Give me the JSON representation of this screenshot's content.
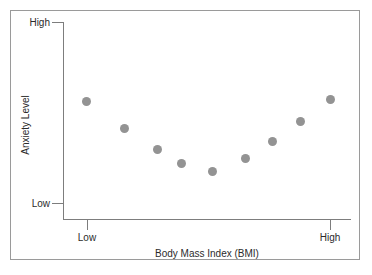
{
  "figure": {
    "background_color": "#ffffff",
    "frame_color": "#9a9a9a",
    "axis_color": "#7d7d7d",
    "marker_color": "#939393"
  },
  "axes": {
    "y_title": "Anxiety Level",
    "x_title": "Body Mass Index (BMI)",
    "y_tick_labels": [
      "High",
      "Low"
    ],
    "x_tick_labels": [
      "Low",
      "High"
    ]
  },
  "chart_data": {
    "type": "scatter",
    "title": "",
    "xlabel": "Body Mass Index (BMI)",
    "ylabel": "Anxiety Level",
    "xlim": [
      0,
      10
    ],
    "ylim": [
      0,
      10
    ],
    "xtick_labels": [
      "Low",
      "High"
    ],
    "xtick_values": [
      1,
      10
    ],
    "ytick_labels": [
      "Low",
      "High"
    ],
    "ytick_values": [
      1,
      10
    ],
    "grid": false,
    "legend": null,
    "annotations": [],
    "series": [
      {
        "name": "Participants",
        "marker": "circle",
        "color": "#939393",
        "points": [
          {
            "x": 1.0,
            "y": 6.9,
            "px": 86,
            "py": 101
          },
          {
            "x": 2.3,
            "y": 5.5,
            "px": 124,
            "py": 128
          },
          {
            "x": 3.4,
            "y": 4.4,
            "px": 157,
            "py": 149
          },
          {
            "x": 4.2,
            "y": 3.7,
            "px": 181,
            "py": 163
          },
          {
            "x": 5.3,
            "y": 3.3,
            "px": 212,
            "py": 171
          },
          {
            "x": 6.4,
            "y": 4.0,
            "px": 245,
            "py": 158
          },
          {
            "x": 7.3,
            "y": 4.9,
            "px": 272,
            "py": 141
          },
          {
            "x": 8.2,
            "y": 5.9,
            "px": 300,
            "py": 121
          },
          {
            "x": 9.2,
            "y": 7.0,
            "px": 330,
            "py": 99
          }
        ]
      }
    ]
  }
}
